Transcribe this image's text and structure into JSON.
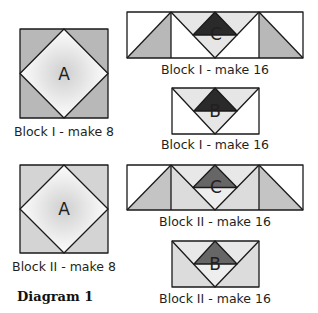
{
  "figure": {
    "title": "Diagram 1",
    "colors": {
      "block1_corner": "#b8b8b8",
      "block2_corner": "#d4d4d4",
      "dark_triangle_block1": "#2a2a2a",
      "dark_triangle_block2": "#666666",
      "light_fill": "#e6e6e6",
      "white": "#ffffff",
      "side_gray_block1": "#b8b8b8",
      "side_gray_block2": "#c4c4c4",
      "outline": "#1a1a1a"
    },
    "blocks": [
      {
        "id": "block1-square",
        "piece": "A",
        "label": "Block I - make 8"
      },
      {
        "id": "block1-strip",
        "piece": "C",
        "label": "Block I - make 16"
      },
      {
        "id": "block1-goose",
        "piece": "B",
        "label": "Block I - make 16"
      },
      {
        "id": "block2-square",
        "piece": "A",
        "label": "Block II - make 8"
      },
      {
        "id": "block2-strip",
        "piece": "C",
        "label": "Block II - make 16"
      },
      {
        "id": "block2-goose",
        "piece": "B",
        "label": "Block II - make 16"
      }
    ]
  }
}
